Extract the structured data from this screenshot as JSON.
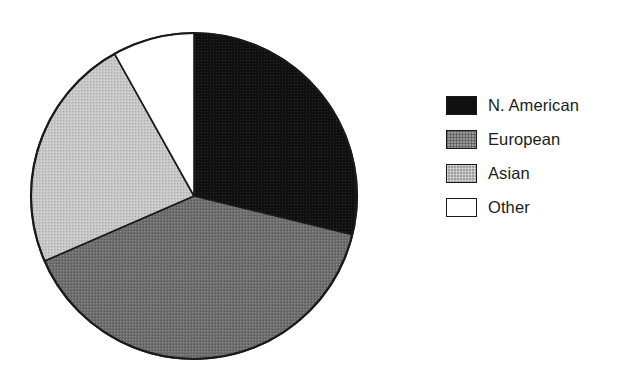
{
  "chart_data": {
    "type": "pie",
    "title": "",
    "subtitle": "",
    "xlabel": "",
    "ylabel": "",
    "grid": false,
    "legend_position": "right",
    "center": {
      "x": 194,
      "y": 196
    },
    "radius": 163,
    "start_angle_deg": 0,
    "direction": "clockwise",
    "categories": [
      "N. American",
      "European",
      "Asian",
      "Other"
    ],
    "values": [
      28.8,
      39.7,
      23.4,
      8.1
    ],
    "units": "percent",
    "slices": [
      {
        "label": "N. American",
        "value": 28.8,
        "angle_deg": 103.7,
        "start_deg": 0.0,
        "end_deg": 103.7,
        "fill": "#101010",
        "fill_name": "black",
        "swatch": "dith-dark"
      },
      {
        "label": "European",
        "value": 39.7,
        "angle_deg": 142.8,
        "start_deg": 103.7,
        "end_deg": 246.5,
        "fill": "#6e6e6e",
        "fill_name": "dark-gray",
        "swatch": "dith-mid"
      },
      {
        "label": "Asian",
        "value": 23.4,
        "angle_deg": 84.3,
        "start_deg": 246.5,
        "end_deg": 330.8,
        "fill": "#c3c3c3",
        "fill_name": "light-gray",
        "swatch": "dith-light"
      },
      {
        "label": "Other",
        "value": 8.1,
        "angle_deg": 29.2,
        "start_deg": 330.8,
        "end_deg": 360.0,
        "fill": "#ffffff",
        "fill_name": "white",
        "swatch": "dith-white"
      }
    ],
    "outline_color": "#1a1a1a",
    "outline_width": 2
  },
  "legend": {
    "entries": [
      {
        "label": "N. American"
      },
      {
        "label": "European"
      },
      {
        "label": "Asian"
      },
      {
        "label": "Other"
      }
    ]
  }
}
